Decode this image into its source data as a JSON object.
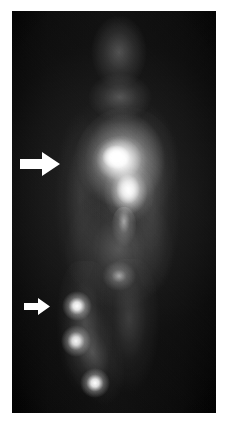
{
  "page": {
    "width": 235,
    "height": 425,
    "background_color": "#ffffff",
    "kind": "nuclear-medicine-scintigraphy-figure"
  },
  "scan": {
    "name": "whole-body-scintigram",
    "modality": "planar gamma camera scintigraphy",
    "view": "anterior whole-body",
    "frame": {
      "x": 12,
      "y": 11,
      "width": 204,
      "height": 402
    },
    "background_color": "#050505",
    "hot_color": "#ffffff",
    "body_silhouette": {
      "description": "faint diffuse soft-tissue outline of head, neck, thorax, abdomen and legs",
      "left_edge_x": 58,
      "right_edge_x": 165,
      "head_center_x": 116,
      "head_top_y": 20
    },
    "foci": [
      {
        "label": "primary-uptake-focus",
        "region": "upper torso / mediastinum",
        "cx": 112,
        "cy": 160,
        "radius": 22,
        "intensity": 1.0,
        "marked_by_arrow": "large-arrow"
      },
      {
        "label": "secondary-uptake-lobe",
        "region": "lower torso",
        "cx": 124,
        "cy": 182,
        "radius": 18,
        "intensity": 0.86
      },
      {
        "label": "faint-focus",
        "region": "pelvis / upper thigh",
        "cx": 113,
        "cy": 275,
        "radius": 9,
        "intensity": 0.42
      },
      {
        "label": "nodal-focus-1",
        "region": "proximal limb chain",
        "cx": 77,
        "cy": 306,
        "radius": 8,
        "intensity": 0.95,
        "marked_by_arrow": "small-arrow"
      },
      {
        "label": "nodal-focus-2",
        "region": "mid limb chain",
        "cx": 76,
        "cy": 340,
        "radius": 8,
        "intensity": 0.9
      },
      {
        "label": "nodal-focus-3",
        "region": "distal limb chain",
        "cx": 95,
        "cy": 383,
        "radius": 8,
        "intensity": 0.93
      }
    ]
  },
  "annotations": {
    "arrows": [
      {
        "name": "large-arrow",
        "label": "upper arrow",
        "direction": "right",
        "color": "#ffffff",
        "x": 20,
        "y": 151,
        "width": 40,
        "height": 26,
        "points_to": "primary-uptake-focus"
      },
      {
        "name": "small-arrow",
        "label": "lower arrow",
        "direction": "right",
        "color": "#ffffff",
        "x": 24,
        "y": 297,
        "width": 26,
        "height": 19,
        "points_to": "nodal-focus-1"
      }
    ]
  }
}
